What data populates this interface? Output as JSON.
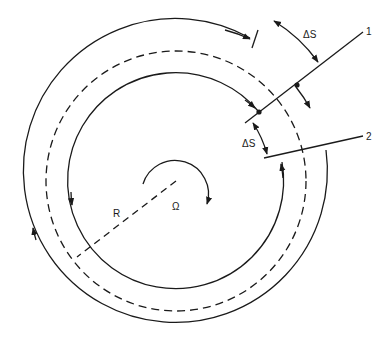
{
  "diagram": {
    "title": "",
    "type": "rotating-disk flow paths",
    "labels": {
      "delta_s_outer": "ΔS",
      "delta_s_inner": "ΔS",
      "line1": "1",
      "line2": "2",
      "radius": "R",
      "omega": "Ω"
    },
    "elements": [
      "outer solid arc with arrows",
      "dashed circle (mean radius)",
      "inner solid arc with arrows",
      "radial line 1",
      "radial line 2",
      "dashed radius line R",
      "rotation arrow Ω"
    ],
    "colors": {
      "stroke": "#1a1a1a",
      "background": "#ffffff"
    }
  }
}
